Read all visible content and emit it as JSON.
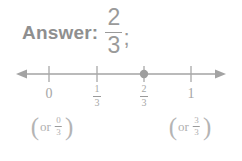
{
  "page": {
    "background_color": "#ffffff",
    "text_color": "#9a9a9a",
    "axis_color": "#a0a0a0"
  },
  "answer": {
    "label": "Answer:",
    "fraction": {
      "numerator": "2",
      "denominator": "3"
    },
    "punctuation": ";"
  },
  "numberline": {
    "range_label_left": "arrow-left",
    "range_label_right": "arrow-right",
    "marked_value": "2/3",
    "ticks": [
      {
        "id": "tick-0",
        "x": 49,
        "type": "plain",
        "value": "0",
        "numerator": "0",
        "denominator": "3"
      },
      {
        "id": "tick-1-3",
        "x": 97,
        "type": "fraction",
        "value": "1/3",
        "numerator": "1",
        "denominator": "3"
      },
      {
        "id": "tick-2-3",
        "x": 144,
        "type": "fraction",
        "value": "2/3",
        "numerator": "2",
        "denominator": "3",
        "marked": true
      },
      {
        "id": "tick-1",
        "x": 191,
        "type": "plain",
        "value": "1",
        "numerator": "3",
        "denominator": "3"
      }
    ],
    "alt_labels": [
      {
        "id": "alt-zero",
        "x": 52,
        "open": "(",
        "text": "or",
        "numerator": "0",
        "denominator": "3",
        "close": ")"
      },
      {
        "id": "alt-one",
        "x": 190,
        "open": "(",
        "text": "or",
        "numerator": "3",
        "denominator": "3",
        "close": ")"
      }
    ]
  }
}
